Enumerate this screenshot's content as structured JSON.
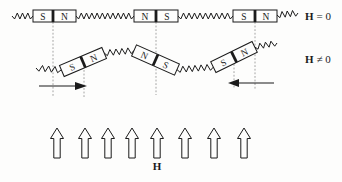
{
  "colors": {
    "background": "#fdfdfc",
    "ink": "#1b1b1b",
    "guide": "#9a9a9a"
  },
  "top_row": {
    "description": "chain of horizontal bar magnets joined by springs, zero applied field",
    "field_label": {
      "symbol": "H",
      "relation": "= 0"
    },
    "magnets": [
      {
        "left": "S",
        "right": "N"
      },
      {
        "left": "N",
        "right": "S"
      },
      {
        "left": "S",
        "right": "N"
      }
    ]
  },
  "middle_row": {
    "description": "same chain with magnets rotated by applied field, centers displaced",
    "field_label": {
      "symbol": "H",
      "relation": "≠ 0"
    },
    "magnets": [
      {
        "left": "S",
        "right": "N"
      },
      {
        "left": "N",
        "right": "S"
      },
      {
        "left": "S",
        "right": "N"
      }
    ]
  },
  "field_arrows": {
    "count": 8,
    "label": "H"
  }
}
